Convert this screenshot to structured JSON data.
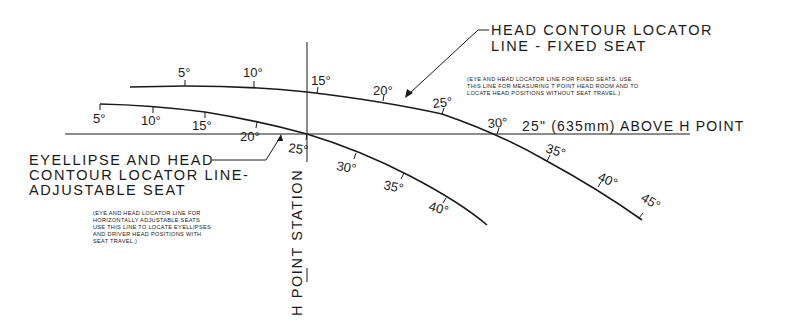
{
  "diagram": {
    "fixed_seat": {
      "title_line1": "HEAD CONTOUR LOCATOR",
      "title_line2": "LINE - FIXED SEAT",
      "note_line1": "(EYE AND HEAD LOCATOR LINE FOR FIXED SEATS. USE",
      "note_line2": "THIS LINE FOR MEASURING T POINT HEAD ROOM AND TO",
      "note_line3": "LOCATE HEAD POSITIONS WITHOUT SEAT TRAVEL.)",
      "angles": [
        "5°",
        "10°",
        "15°",
        "20°",
        "25°",
        "30°",
        "35°",
        "40°",
        "45°"
      ]
    },
    "adjustable_seat": {
      "title_line1": "EYELLIPSE AND HEAD",
      "title_line2": "CONTOUR LOCATOR LINE-",
      "title_line3": "ADJUSTABLE SEAT",
      "note_line1": "(EYE AND HEAD LOCATOR LINE FOR",
      "note_line2": "HORIZONTALLY ADJUSTABLE SEATS",
      "note_line3": "USE THIS LINE TO LOCATE EYELLIPSES",
      "note_line4": "AND DRIVER HEAD POSITIONS WITH",
      "note_line5": "SEAT TRAVEL.)",
      "angles": [
        "5°",
        "10°",
        "15°",
        "20°",
        "25°",
        "30°",
        "35°",
        "40°"
      ]
    },
    "reference_line_label": "25\" (635mm) ABOVE H POINT",
    "station_label": "H POINT STATION"
  }
}
